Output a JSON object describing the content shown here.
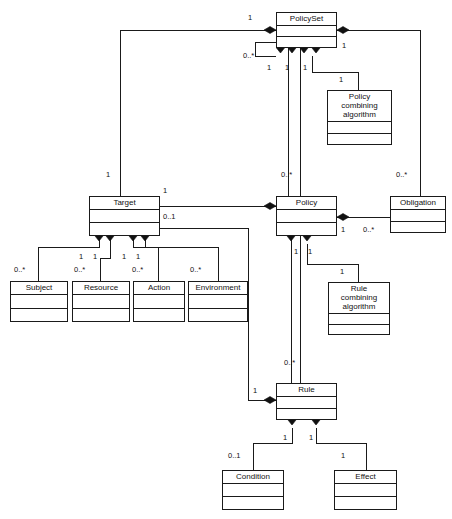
{
  "diagram": {
    "type": "uml-class-diagram",
    "background": "#ffffff",
    "line_color": "#1a1a1a"
  },
  "classes": [
    {
      "id": "policyset",
      "name": "PolicySet",
      "x": 276,
      "y": 12,
      "w": 61,
      "h": 36
    },
    {
      "id": "pca",
      "name": "Policy\ncombining\nalgorithm",
      "x": 327,
      "y": 90,
      "w": 65,
      "h": 55
    },
    {
      "id": "target",
      "name": "Target",
      "x": 89,
      "y": 196,
      "w": 71,
      "h": 40
    },
    {
      "id": "policy",
      "name": "Policy",
      "x": 276,
      "y": 196,
      "w": 61,
      "h": 40
    },
    {
      "id": "obligation",
      "name": "Obligation",
      "x": 390,
      "y": 196,
      "w": 56,
      "h": 37
    },
    {
      "id": "subject",
      "name": "Subject",
      "x": 10,
      "y": 281,
      "w": 58,
      "h": 41
    },
    {
      "id": "resource",
      "name": "Resource",
      "x": 72,
      "y": 281,
      "w": 58,
      "h": 41
    },
    {
      "id": "action",
      "name": "Action",
      "x": 133,
      "y": 281,
      "w": 52,
      "h": 41
    },
    {
      "id": "environment",
      "name": "Environment",
      "x": 188,
      "y": 281,
      "w": 60,
      "h": 41
    },
    {
      "id": "rca",
      "name": "Rule\ncombining\nalgorithm",
      "x": 328,
      "y": 282,
      "w": 62,
      "h": 53
    },
    {
      "id": "rule",
      "name": "Rule",
      "x": 276,
      "y": 383,
      "w": 61,
      "h": 37
    },
    {
      "id": "condition",
      "name": "Condition",
      "x": 222,
      "y": 470,
      "w": 62,
      "h": 40
    },
    {
      "id": "effect",
      "name": "Effect",
      "x": 334,
      "y": 470,
      "w": 63,
      "h": 40
    }
  ],
  "multiplicities": [
    {
      "id": "m-ps-self-left",
      "label": "1",
      "x": 248,
      "y": 14
    },
    {
      "id": "m-ps-self-down",
      "label": "0..*",
      "x": 243,
      "y": 52
    },
    {
      "id": "m-ps-target",
      "label": "1",
      "x": 267,
      "y": 64
    },
    {
      "id": "m-ps-policy",
      "label": "1",
      "x": 285,
      "y": 64
    },
    {
      "id": "m-ps-pca-top",
      "label": "1",
      "x": 303,
      "y": 64
    },
    {
      "id": "m-ps-oblig",
      "label": "1",
      "x": 342,
      "y": 42
    },
    {
      "id": "m-pca",
      "label": "1",
      "x": 339,
      "y": 76
    },
    {
      "id": "m-target-up",
      "label": "1",
      "x": 106,
      "y": 171
    },
    {
      "id": "m-target-right-1",
      "label": "1",
      "x": 163,
      "y": 187
    },
    {
      "id": "m-target-rule",
      "label": "0..1",
      "x": 163,
      "y": 213
    },
    {
      "id": "m-policy-up",
      "label": "0..*",
      "x": 281,
      "y": 171
    },
    {
      "id": "m-oblig-up",
      "label": "0..*",
      "x": 396,
      "y": 171
    },
    {
      "id": "m-policy-oblig-1",
      "label": "1",
      "x": 341,
      "y": 226
    },
    {
      "id": "m-policy-oblig-n",
      "label": "0..*",
      "x": 363,
      "y": 226
    },
    {
      "id": "m-target-sub-a",
      "label": "1",
      "x": 79,
      "y": 253
    },
    {
      "id": "m-target-sub-b",
      "label": "1",
      "x": 93,
      "y": 253
    },
    {
      "id": "m-target-sub-c",
      "label": "1",
      "x": 122,
      "y": 253
    },
    {
      "id": "m-target-sub-d",
      "label": "1",
      "x": 136,
      "y": 253
    },
    {
      "id": "m-subject",
      "label": "0..*",
      "x": 14,
      "y": 266
    },
    {
      "id": "m-resource",
      "label": "0..*",
      "x": 74,
      "y": 266
    },
    {
      "id": "m-action",
      "label": "0..*",
      "x": 132,
      "y": 266
    },
    {
      "id": "m-environment",
      "label": "0..*",
      "x": 190,
      "y": 266
    },
    {
      "id": "m-policy-rule-1",
      "label": "1",
      "x": 294,
      "y": 248
    },
    {
      "id": "m-policy-rca-1",
      "label": "1",
      "x": 308,
      "y": 248
    },
    {
      "id": "m-rca",
      "label": "1",
      "x": 340,
      "y": 268
    },
    {
      "id": "m-rule-up",
      "label": "0..*",
      "x": 284,
      "y": 359
    },
    {
      "id": "m-rule-target",
      "label": "1",
      "x": 253,
      "y": 387
    },
    {
      "id": "m-rule-cond-1",
      "label": "1",
      "x": 283,
      "y": 434
    },
    {
      "id": "m-rule-eff-1",
      "label": "1",
      "x": 309,
      "y": 434
    },
    {
      "id": "m-condition",
      "label": "0..1",
      "x": 228,
      "y": 452
    },
    {
      "id": "m-effect",
      "label": "1",
      "x": 341,
      "y": 452
    }
  ],
  "edges": [
    {
      "id": "edge-policyset-self",
      "from": "PolicySet",
      "to": "PolicySet",
      "kind": "composition"
    },
    {
      "id": "edge-policyset-target",
      "from": "PolicySet",
      "to": "Target",
      "kind": "composition"
    },
    {
      "id": "edge-policyset-policy",
      "from": "PolicySet",
      "to": "Policy",
      "kind": "composition"
    },
    {
      "id": "edge-policyset-pca",
      "from": "PolicySet",
      "to": "Policy combining algorithm",
      "kind": "composition"
    },
    {
      "id": "edge-policyset-obligation",
      "from": "PolicySet",
      "to": "Obligation",
      "kind": "composition"
    },
    {
      "id": "edge-policy-target",
      "from": "Policy",
      "to": "Target",
      "kind": "composition"
    },
    {
      "id": "edge-policy-obligation",
      "from": "Policy",
      "to": "Obligation",
      "kind": "composition"
    },
    {
      "id": "edge-policy-rule",
      "from": "Policy",
      "to": "Rule",
      "kind": "composition"
    },
    {
      "id": "edge-policy-rca",
      "from": "Policy",
      "to": "Rule combining algorithm",
      "kind": "composition"
    },
    {
      "id": "edge-target-subject",
      "from": "Target",
      "to": "Subject",
      "kind": "composition"
    },
    {
      "id": "edge-target-resource",
      "from": "Target",
      "to": "Resource",
      "kind": "composition"
    },
    {
      "id": "edge-target-action",
      "from": "Target",
      "to": "Action",
      "kind": "composition"
    },
    {
      "id": "edge-target-environment",
      "from": "Target",
      "to": "Environment",
      "kind": "composition"
    },
    {
      "id": "edge-rule-target",
      "from": "Rule",
      "to": "Target",
      "kind": "composition"
    },
    {
      "id": "edge-rule-condition",
      "from": "Rule",
      "to": "Condition",
      "kind": "composition"
    },
    {
      "id": "edge-rule-effect",
      "from": "Rule",
      "to": "Effect",
      "kind": "composition"
    }
  ]
}
